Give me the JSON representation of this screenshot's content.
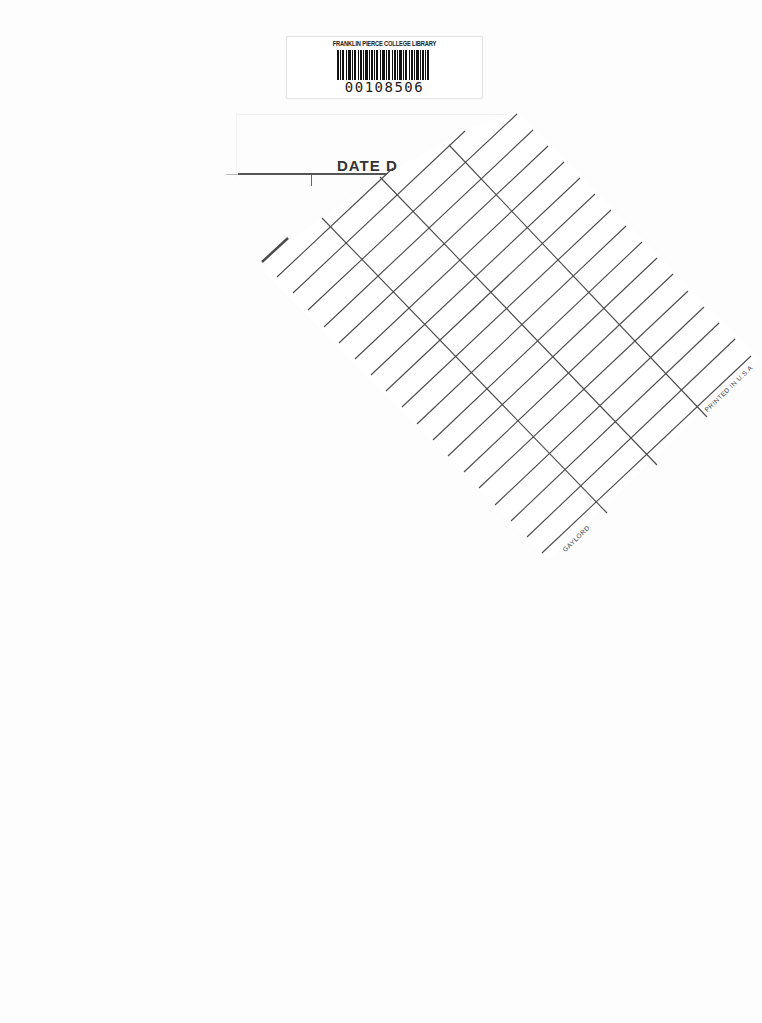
{
  "library_label": {
    "institution": "FRANKLIN PIERCE COLLEGE LIBRARY",
    "barcode_number": "00108506",
    "barcode_icon": "barcode-icon"
  },
  "date_due_card": {
    "header": "DATE D",
    "header_full_hint": "DATE DUE",
    "manufacturer": "GAYLORD",
    "printed_note": "PRINTED IN U.S.A",
    "rows": 20,
    "columns": 3,
    "line_color": "#555555",
    "paper_color": "#ffffff"
  },
  "page": {
    "background_color": "#fdfdfd"
  }
}
